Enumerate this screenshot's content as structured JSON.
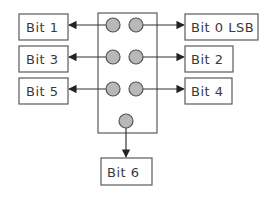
{
  "diagram": {
    "left_labels": [
      "Bit 1",
      "Bit 3",
      "Bit 5"
    ],
    "right_labels": [
      "Bit 0 LSB",
      "Bit 2",
      "Bit 4"
    ],
    "bottom_label": "Bit 6",
    "colors": {
      "dot_fill": "#b8b8b8",
      "stroke": "#5a5a5a",
      "arrow": "#333333"
    }
  }
}
